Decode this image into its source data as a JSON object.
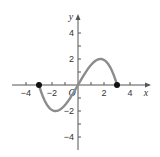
{
  "chart_data": {
    "type": "line",
    "title": "",
    "xlabel": "x",
    "ylabel": "y",
    "origin_label": "O",
    "xlim": [
      -5,
      5
    ],
    "ylim": [
      -5,
      5
    ],
    "x_ticks": [
      -4,
      -3,
      -2,
      -1,
      1,
      2,
      3,
      4
    ],
    "x_tick_labels": [
      "-4",
      "-2",
      "2",
      "4"
    ],
    "y_ticks": [
      -4,
      -3,
      -2,
      -1,
      1,
      2,
      3,
      4
    ],
    "y_tick_labels": [
      "4",
      "2",
      "-2",
      "-4"
    ],
    "grid": false,
    "series": [
      {
        "name": "f(x)",
        "color": "#8c8c8c",
        "x": [
          -3,
          -2.5,
          -2,
          -1.73,
          -1.5,
          -1,
          -0.5,
          0,
          0.5,
          1,
          1.5,
          1.73,
          2,
          2.5,
          3
        ],
        "y": [
          0,
          -1.32,
          -1.92,
          -2.0,
          -1.95,
          -1.54,
          -0.84,
          0,
          0.84,
          1.54,
          1.95,
          2.0,
          1.92,
          1.32,
          0
        ]
      }
    ],
    "endpoints": [
      {
        "x": -3,
        "y": 0,
        "filled": true
      },
      {
        "x": 3,
        "y": 0,
        "filled": true
      }
    ]
  },
  "labels": {
    "x_axis": "x",
    "y_axis": "y",
    "origin": "O",
    "xt_m4": "−4",
    "xt_m2": "−2",
    "xt_2": "2",
    "xt_4": "4",
    "yt_4": "4",
    "yt_2": "2",
    "yt_m2": "−2",
    "yt_m4": "−4"
  }
}
